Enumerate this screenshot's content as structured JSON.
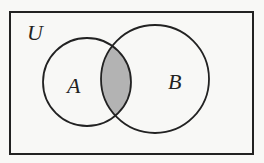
{
  "diagram": {
    "type": "venn",
    "universe": {
      "label": "U",
      "rect": {
        "x": 10,
        "y": 12,
        "width": 243,
        "height": 142
      },
      "label_pos": {
        "x": 27,
        "y": 40
      }
    },
    "sets": [
      {
        "label": "A",
        "circle": {
          "cx": 87,
          "cy": 82,
          "r": 44
        },
        "label_pos": {
          "x": 67,
          "y": 93
        }
      },
      {
        "label": "B",
        "circle": {
          "cx": 155,
          "cy": 79,
          "r": 54
        },
        "label_pos": {
          "x": 168,
          "y": 89
        }
      }
    ],
    "shaded_region": "A ∩ B",
    "colors": {
      "stroke": "#222222",
      "shade": "#b3b3b3",
      "background": "#f8f8f6"
    }
  }
}
